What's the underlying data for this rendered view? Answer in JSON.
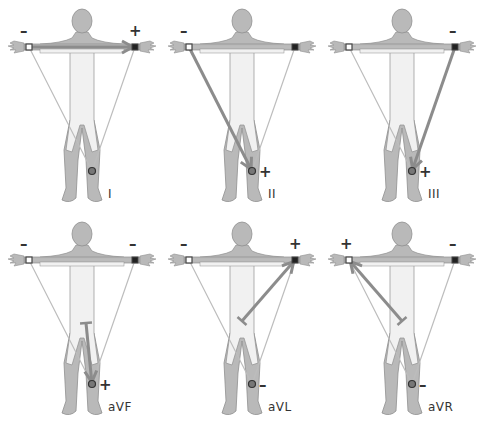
{
  "top_text_clipped": "(partially visible caption clipped at top edge)",
  "colors": {
    "body_fill": "#b9b9b9",
    "body_outline": "#8f8f8f",
    "torso_light": "#f1f1f1",
    "triangle_line": "#bdbdbd",
    "lead_arrow": "#8c8c8c",
    "electrode_ra": "#ffffff",
    "electrode_la": "#222222",
    "text": "#333333"
  },
  "panels": [
    {
      "id": "I",
      "label": "I",
      "ra_sign": "–",
      "la_sign": "+",
      "ll_sign": "",
      "arrow": "ra-to-la"
    },
    {
      "id": "II",
      "label": "II",
      "ra_sign": "–",
      "la_sign": "",
      "ll_sign": "+",
      "arrow": "ra-to-ll"
    },
    {
      "id": "III",
      "label": "III",
      "ra_sign": "",
      "la_sign": "–",
      "ll_sign": "+",
      "arrow": "la-to-ll"
    },
    {
      "id": "aVF",
      "label": "aVF",
      "ra_sign": "–",
      "la_sign": "–",
      "ll_sign": "+",
      "arrow": "center-to-ll"
    },
    {
      "id": "aVL",
      "label": "aVL",
      "ra_sign": "–",
      "la_sign": "+",
      "ll_sign": "–",
      "arrow": "center-to-la"
    },
    {
      "id": "aVR",
      "label": "aVR",
      "ra_sign": "+",
      "la_sign": "–",
      "ll_sign": "–",
      "arrow": "center-to-ra"
    }
  ]
}
